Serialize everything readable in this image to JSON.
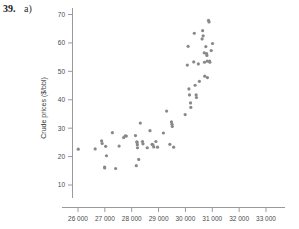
{
  "exercise": {
    "number": "39.",
    "part": "a)"
  },
  "chart_data": {
    "type": "scatter",
    "title": "",
    "xlabel": "",
    "ylabel": "Crude prices ($/bbl)",
    "xlim": [
      25600,
      33400
    ],
    "ylim": [
      5,
      74
    ],
    "grid": false,
    "legend": null,
    "marker": {
      "shape": "circle",
      "color": "#888888",
      "size_px": 3.2
    },
    "xticks": [
      26000,
      27000,
      28000,
      29000,
      30000,
      31000,
      32000,
      33000
    ],
    "xticklabels": [
      "26 000",
      "27 000",
      "28 000",
      "29 000",
      "30 000",
      "31 000",
      "32 000",
      "33 000"
    ],
    "yticks": [
      10,
      20,
      30,
      40,
      50,
      60,
      70
    ],
    "yticklabels": [
      "10",
      "20",
      "30",
      "40",
      "50",
      "60",
      "70"
    ],
    "points": [
      [
        26010,
        22.6
      ],
      [
        26640,
        22.7
      ],
      [
        26880,
        25.5
      ],
      [
        26900,
        24.6
      ],
      [
        26990,
        16.3
      ],
      [
        26995,
        16.0
      ],
      [
        27030,
        23.6
      ],
      [
        27060,
        20.3
      ],
      [
        27280,
        28.4
      ],
      [
        27400,
        15.8
      ],
      [
        27530,
        23.7
      ],
      [
        27700,
        26.7
      ],
      [
        27760,
        27.3
      ],
      [
        27800,
        27.2
      ],
      [
        28140,
        27.4
      ],
      [
        28170,
        16.8
      ],
      [
        28190,
        25.2
      ],
      [
        28200,
        25.0
      ],
      [
        28210,
        24.2
      ],
      [
        28215,
        23.1
      ],
      [
        28260,
        19.0
      ],
      [
        28320,
        31.8
      ],
      [
        28400,
        25.3
      ],
      [
        28420,
        24.5
      ],
      [
        28580,
        23.1
      ],
      [
        28680,
        29.1
      ],
      [
        28760,
        24.3
      ],
      [
        28790,
        24.1
      ],
      [
        28820,
        23.4
      ],
      [
        28900,
        25.3
      ],
      [
        28960,
        23.3
      ],
      [
        29180,
        28.3
      ],
      [
        29300,
        36.0
      ],
      [
        29420,
        24.3
      ],
      [
        29480,
        32.2
      ],
      [
        29500,
        31.4
      ],
      [
        29510,
        30.6
      ],
      [
        29560,
        23.3
      ],
      [
        29990,
        34.8
      ],
      [
        30070,
        52.2
      ],
      [
        30100,
        58.8
      ],
      [
        30130,
        43.8
      ],
      [
        30150,
        41.7
      ],
      [
        30190,
        38.9
      ],
      [
        30200,
        37.3
      ],
      [
        30310,
        53.3
      ],
      [
        30330,
        63.4
      ],
      [
        30360,
        45.1
      ],
      [
        30400,
        41.7
      ],
      [
        30410,
        40.8
      ],
      [
        30480,
        52.6
      ],
      [
        30520,
        46.5
      ],
      [
        30620,
        61.4
      ],
      [
        30640,
        64.3
      ],
      [
        30660,
        62.5
      ],
      [
        30700,
        56.5
      ],
      [
        30710,
        53.2
      ],
      [
        30720,
        48.3
      ],
      [
        30760,
        58.7
      ],
      [
        30790,
        56.2
      ],
      [
        30800,
        55.6
      ],
      [
        30810,
        53.6
      ],
      [
        30820,
        47.8
      ],
      [
        30860,
        67.9
      ],
      [
        30880,
        67.4
      ],
      [
        30900,
        53.6
      ],
      [
        30910,
        53.2
      ],
      [
        30960,
        57.3
      ],
      [
        31010,
        59.8
      ]
    ]
  }
}
